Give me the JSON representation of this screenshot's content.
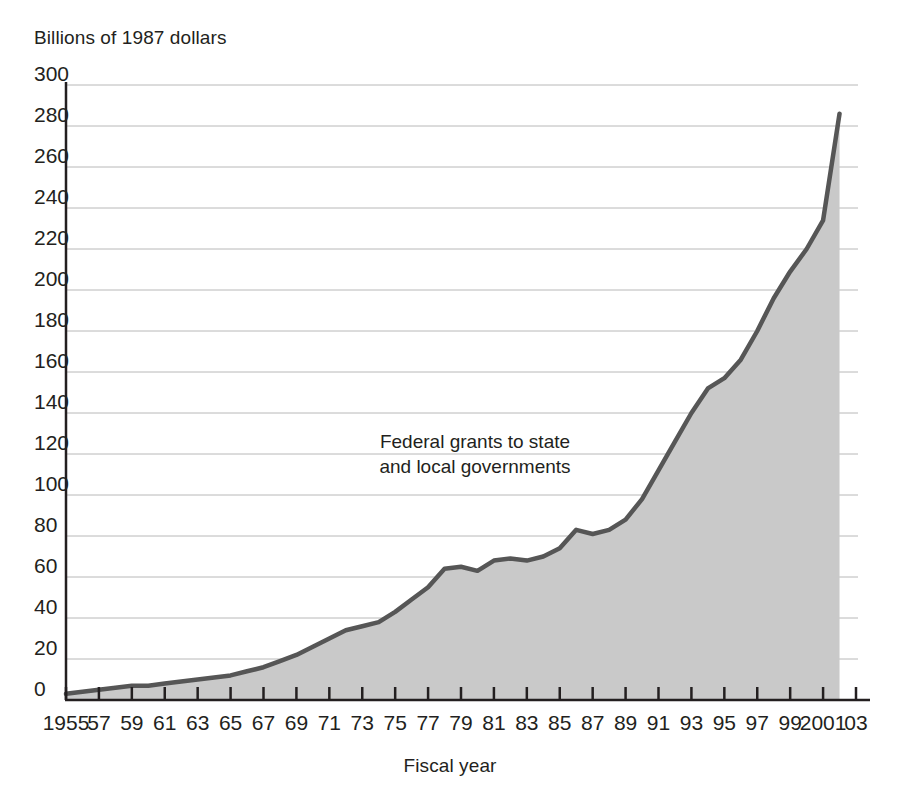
{
  "chart_data": {
    "type": "area",
    "title": "",
    "ylabel": "Billions of 1987 dollars",
    "xlabel": "Fiscal year",
    "annotation": "Federal grants to state and local governments",
    "annotation_line1": "Federal grants to state",
    "annotation_line2": "and local governments",
    "series_name": "Federal grants to state and local governments",
    "ylim": [
      0,
      300
    ],
    "ytick_step": 20,
    "yticks": [
      300,
      280,
      260,
      240,
      220,
      200,
      180,
      160,
      140,
      120,
      100,
      80,
      60,
      40,
      20,
      0
    ],
    "ytick_labels": [
      "300",
      "280",
      "260",
      "240",
      "220",
      "200",
      "180",
      "160",
      "140",
      "120",
      "100",
      "80",
      "60",
      "40",
      "20",
      "0"
    ],
    "xlim": [
      1955,
      2003
    ],
    "xtick_step": 2,
    "xticks": [
      1955,
      1957,
      1959,
      1961,
      1963,
      1965,
      1967,
      1969,
      1971,
      1973,
      1975,
      1977,
      1979,
      1981,
      1983,
      1985,
      1987,
      1989,
      1991,
      1993,
      1995,
      1997,
      1999,
      2001,
      2003
    ],
    "xtick_labels": [
      "1955",
      "57",
      "59",
      "61",
      "63",
      "65",
      "67",
      "69",
      "71",
      "73",
      "75",
      "77",
      "79",
      "81",
      "83",
      "85",
      "87",
      "89",
      "91",
      "93",
      "95",
      "97",
      "99",
      "2001",
      "03"
    ],
    "grid": true,
    "grid_axis": "y",
    "legend": "none",
    "x": [
      1955,
      1956,
      1957,
      1958,
      1959,
      1960,
      1961,
      1962,
      1963,
      1964,
      1965,
      1966,
      1967,
      1968,
      1969,
      1970,
      1971,
      1972,
      1973,
      1974,
      1975,
      1976,
      1977,
      1978,
      1979,
      1980,
      1981,
      1982,
      1983,
      1984,
      1985,
      1986,
      1987,
      1988,
      1989,
      1990,
      1991,
      1992,
      1993,
      1994,
      1995,
      1996,
      1997,
      1998,
      1999,
      2000,
      2001,
      2002
    ],
    "values": [
      3,
      4,
      5,
      6,
      7,
      7,
      8,
      9,
      10,
      11,
      12,
      14,
      16,
      19,
      22,
      26,
      30,
      34,
      36,
      38,
      43,
      49,
      55,
      64,
      65,
      63,
      68,
      69,
      68,
      70,
      74,
      83,
      81,
      83,
      88,
      98,
      112,
      126,
      140,
      152,
      157,
      166,
      180,
      196,
      209,
      220,
      234,
      286
    ]
  },
  "style": {
    "fill_color": "#c9c9c9",
    "line_color": "#565656",
    "grid_color": "#b8b8b8",
    "axis_color": "#231f20",
    "text_color": "#231f20",
    "background": "#ffffff"
  }
}
